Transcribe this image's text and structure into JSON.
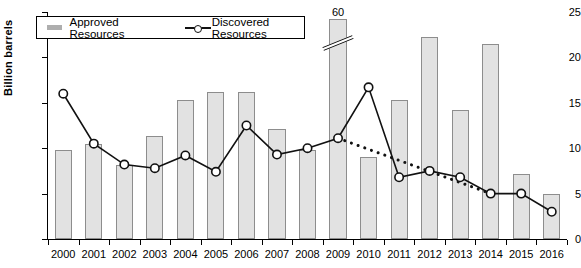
{
  "chart_data": {
    "type": "bar",
    "title": "",
    "xlabel": "",
    "ylabel": "Billion barrels",
    "ylim": [
      0,
      25
    ],
    "yticks": [
      0,
      5,
      10,
      15,
      20,
      25
    ],
    "grid": false,
    "legend_position": "top-left",
    "categories": [
      "2000",
      "2001",
      "2002",
      "2003",
      "2004",
      "2005",
      "2006",
      "2007",
      "2008",
      "2009",
      "2010",
      "2011",
      "2012",
      "2013",
      "2014",
      "2015",
      "2016"
    ],
    "series": [
      {
        "name": "Approved Resources",
        "type": "bar",
        "color": "#e2e2e2",
        "values": [
          9.8,
          10.5,
          8.2,
          11.3,
          15.3,
          16.2,
          16.2,
          12.1,
          9.8,
          60,
          9.0,
          15.3,
          22.2,
          14.2,
          21.5,
          7.2,
          5.0
        ]
      },
      {
        "name": "Discovered Resources",
        "type": "line",
        "color": "#111111",
        "values": [
          16.0,
          10.5,
          8.2,
          7.8,
          9.2,
          7.4,
          12.5,
          9.3,
          10.0,
          11.1,
          16.7,
          6.8,
          7.5,
          6.8,
          5.0,
          5.0,
          3.0
        ]
      },
      {
        "name": "Trend",
        "type": "dotted-line",
        "color": "#111111",
        "x": [
          "2009",
          "2014"
        ],
        "values": [
          11.1,
          5.0
        ]
      }
    ],
    "annotations": [
      {
        "text": "60",
        "category": "2009",
        "note": "broken bar value label"
      }
    ]
  },
  "legend": {
    "approved_label": "Approved Resources",
    "discovered_label": "Discovered Resources"
  },
  "axis": {
    "y_title": "Billion barrels"
  }
}
